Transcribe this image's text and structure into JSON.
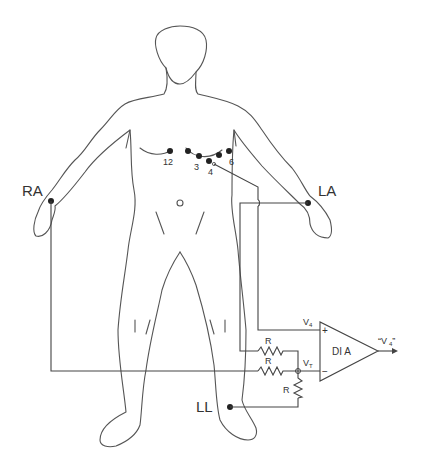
{
  "limb_leads": {
    "right_arm": "RA",
    "left_arm": "LA",
    "left_leg": "LL"
  },
  "chest_electrodes": [
    "12",
    "3",
    "4",
    "6"
  ],
  "circuit": {
    "resistor_label": "R",
    "plus_input_label": "V",
    "plus_input_sub": "4",
    "minus_input_label": "V",
    "minus_input_sub": "T",
    "amplifier_label": "DI A",
    "output_label": "“V",
    "output_sub": "4",
    "output_close": "”",
    "plus_sign": "+",
    "minus_sign": "−"
  },
  "colors": {
    "line": "#444444",
    "electrode": "#222222",
    "background": "#ffffff"
  }
}
